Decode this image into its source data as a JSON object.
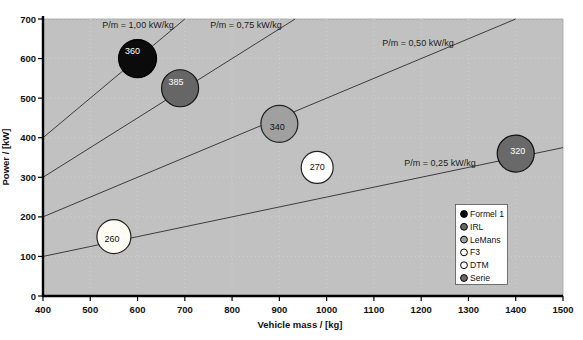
{
  "chart_data": {
    "type": "scatter",
    "subtype": "bubble",
    "title": "",
    "xlabel": "Vehicle mass / [kg]",
    "ylabel": "Power / [kW]",
    "xlim": [
      400,
      1500
    ],
    "ylim": [
      0,
      700
    ],
    "xticks": [
      400,
      500,
      600,
      700,
      800,
      900,
      1000,
      1100,
      1200,
      1300,
      1400,
      1500
    ],
    "yticks": [
      0,
      100,
      200,
      300,
      400,
      500,
      600,
      700
    ],
    "grid": true,
    "legend_position": "bottom-right",
    "reference_lines": [
      {
        "label": "P/m = 1,00 kW/kg",
        "ratio_kw_per_kg": 1.0,
        "label_px": {
          "x": 138,
          "y": 28
        }
      },
      {
        "label": "P/m = 0,75 kW/kg",
        "ratio_kw_per_kg": 0.75,
        "label_px": {
          "x": 246,
          "y": 28
        }
      },
      {
        "label": "P/m = 0,50 kW/kg",
        "ratio_kw_per_kg": 0.5,
        "label_px": {
          "x": 418,
          "y": 46
        }
      },
      {
        "label": "P/m = 0,25 kW/kg",
        "ratio_kw_per_kg": 0.25,
        "label_px": {
          "x": 440,
          "y": 166
        }
      }
    ],
    "series": [
      {
        "name": "Formel 1",
        "mass_kg": 600,
        "power_kw": 600,
        "vmax_kmh": 360,
        "bubble_label": "360",
        "fill": "#0b0b0b",
        "stroke": "#000000",
        "text_color": "#ffffff",
        "r": 19,
        "label_offset": [
          -5,
          -8
        ]
      },
      {
        "name": "IRL",
        "mass_kg": 690,
        "power_kw": 525,
        "vmax_kmh": 385,
        "bubble_label": "385",
        "fill": "#666666",
        "stroke": "#111111",
        "text_color": "#ffffff",
        "r": 18.5,
        "label_offset": [
          -4,
          -6
        ]
      },
      {
        "name": "LeMans",
        "mass_kg": 900,
        "power_kw": 435,
        "vmax_kmh": 340,
        "bubble_label": "340",
        "fill": "#a0a0a0",
        "stroke": "#222222",
        "text_color": "#111111",
        "r": 18.5,
        "label_offset": [
          -2,
          3
        ]
      },
      {
        "name": "F3",
        "mass_kg": 550,
        "power_kw": 150,
        "vmax_kmh": 260,
        "bubble_label": "260",
        "fill": "#fdfdf4",
        "stroke": "#222222",
        "text_color": "#111111",
        "r": 17,
        "label_offset": [
          -2,
          2
        ]
      },
      {
        "name": "DTM",
        "mass_kg": 980,
        "power_kw": 325,
        "vmax_kmh": 270,
        "bubble_label": "270",
        "fill": "#ffffff",
        "stroke": "#222222",
        "text_color": "#111111",
        "r": 16,
        "label_offset": [
          0,
          0
        ]
      },
      {
        "name": "Serie",
        "mass_kg": 1400,
        "power_kw": 360,
        "vmax_kmh": 320,
        "bubble_label": "320",
        "fill": "#696969",
        "stroke": "#111111",
        "text_color": "#ffffff",
        "r": 18.5,
        "label_offset": [
          2,
          -3
        ]
      }
    ],
    "legend_items": [
      "Formel 1",
      "IRL",
      "LeMans",
      "F3",
      "DTM",
      "Serie"
    ],
    "colors": {
      "plot_background": "#c1c1c1",
      "gridline": "#cfcfcf",
      "reference_line": "#3c3c3c",
      "axis": "#000000",
      "tick_text": "#111111",
      "legend_background": "#ffffff",
      "legend_border": "#555555"
    }
  }
}
